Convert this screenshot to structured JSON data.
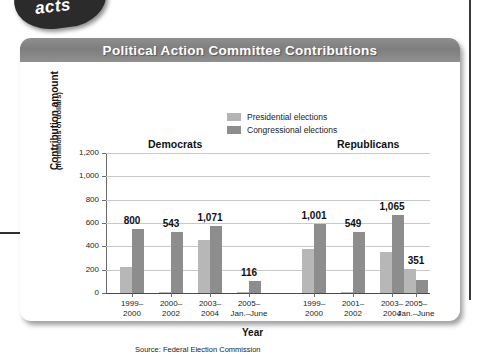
{
  "figure": {
    "title": "Political Action Committee Contributions",
    "x_axis_title": "Year",
    "y_axis_title_main": "Contribution amount",
    "y_axis_title_sub": "(In millions of dollars)",
    "source_note": "Source: Federal Election Commission",
    "badge_text": "acts",
    "colors": {
      "title_bar": "#808080",
      "presidential_bar": "#b7b7b7",
      "congressional_bar": "#8d8d8d",
      "gridline": "#c9c9c9",
      "axis": "#4a4a4a",
      "card_background": "#ffffff",
      "title_text": "#ffffff"
    }
  },
  "legend": {
    "position": "top-center",
    "entries": [
      {
        "label": "Presidential elections",
        "color": "#b7b7b7",
        "key": "presidential"
      },
      {
        "label": "Congressional elections",
        "color": "#8d8d8d",
        "key": "congressional"
      }
    ]
  },
  "groups": [
    {
      "id": "democrats",
      "header": "Democrats"
    },
    {
      "id": "republicans",
      "header": "Republicans"
    }
  ],
  "chart_data": {
    "type": "bar",
    "title": "Political Action Committee Contributions",
    "subtitle": "",
    "xlabel": "Year",
    "ylabel": "Contribution amount (In millions of dollars)",
    "ylim": [
      0,
      1200
    ],
    "ytick_labels": [
      "1,200",
      "1,000",
      "800",
      "600",
      "400",
      "200",
      "0"
    ],
    "ytick_values": [
      1200,
      1000,
      800,
      600,
      400,
      200,
      0
    ],
    "grid": true,
    "legend_position": "top-center",
    "group_labels": [
      "Democrats",
      "Republicans"
    ],
    "categories": [
      {
        "group": "Democrats",
        "line1": "1999–",
        "line2": "2000"
      },
      {
        "group": "Democrats",
        "line1": "2000–",
        "line2": "2002"
      },
      {
        "group": "Democrats",
        "line1": "2003–",
        "line2": "2004"
      },
      {
        "group": "Democrats",
        "line1": "2005–",
        "line2": "Jan.–June"
      },
      {
        "group": "Republicans",
        "line1": "1999–",
        "line2": "2000"
      },
      {
        "group": "Republicans",
        "line1": "2001–",
        "line2": "2002"
      },
      {
        "group": "Republicans",
        "line1": "2003–",
        "line2": "2004"
      },
      {
        "group": "Republicans",
        "line1": "2005–",
        "line2": "Jan.–June"
      }
    ],
    "series": [
      {
        "name": "Presidential elections",
        "color": "#b7b7b7",
        "values": [
          220,
          5,
          455,
          5,
          380,
          5,
          350,
          210
        ]
      },
      {
        "name": "Congressional elections",
        "color": "#8d8d8d",
        "values": [
          550,
          520,
          575,
          100,
          595,
          520,
          670,
          110
        ]
      }
    ],
    "total_labels": [
      "800",
      "543",
      "1,071",
      "116",
      "1,001",
      "549",
      "1,065",
      "351"
    ],
    "total_values": [
      800,
      543,
      1071,
      116,
      1001,
      549,
      1065,
      351
    ]
  }
}
